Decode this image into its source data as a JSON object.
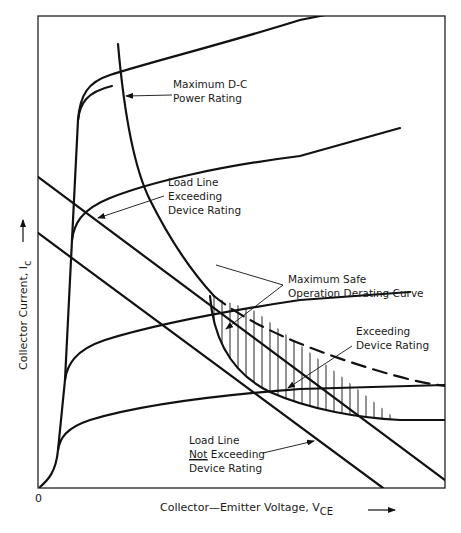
{
  "diagram": {
    "type": "transistor-output-characteristics",
    "axes": {
      "x_label": "Collector—Emitter Voltage, V",
      "x_label_subscript": "CE",
      "y_label": "Collector Current, I",
      "y_label_subscript": "c",
      "origin_label": "0"
    },
    "annotations": {
      "max_dc_power": [
        "Maximum D-C",
        "Power Rating"
      ],
      "load_line_exceeding": [
        "Load Line",
        "Exceeding",
        "Device Rating"
      ],
      "max_safe_derating": [
        "Maximum Safe",
        "Operation Derating Curve"
      ],
      "exceeding_rating": [
        "Exceeding",
        "Device Rating"
      ],
      "load_line_not_exceeding": [
        "Load Line",
        "Not",
        " Exceeding",
        "Device Rating"
      ]
    },
    "colors": {
      "ink": "#111111",
      "background": "#ffffff"
    }
  }
}
